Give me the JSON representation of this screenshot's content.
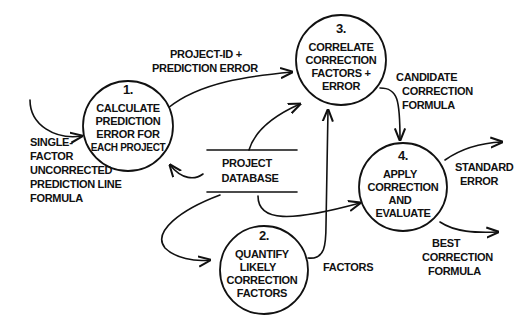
{
  "diagram": {
    "type": "data-flow-diagram",
    "processes": [
      {
        "id": "1",
        "number": "1.",
        "lines": [
          "CALCULATE",
          "PREDICTION",
          "ERROR FOR",
          "EACH PROJECT"
        ]
      },
      {
        "id": "2",
        "number": "2.",
        "lines": [
          "QUANTIFY",
          "LIKELY",
          "CORRECTION",
          "FACTORS"
        ]
      },
      {
        "id": "3",
        "number": "3.",
        "lines": [
          "CORRELATE",
          "CORRECTION",
          "FACTORS +",
          "ERROR"
        ]
      },
      {
        "id": "4",
        "number": "4.",
        "lines": [
          "APPLY",
          "CORRECTION",
          "AND",
          "EVALUATE"
        ]
      }
    ],
    "datastore": {
      "lines": [
        "PROJECT",
        "DATABASE"
      ]
    },
    "flows": {
      "input_formula": [
        "SINGLE-",
        "FACTOR",
        "UNCORRECTED",
        "PREDICTION LINE",
        "FORMULA"
      ],
      "project_id_error": [
        "PROJECT-ID +",
        "PREDICTION ERROR"
      ],
      "candidate_formula": [
        "CANDIDATE",
        "CORRECTION",
        "FORMULA"
      ],
      "factors": [
        "FACTORS"
      ],
      "standard_error": [
        "STANDARD",
        "ERROR"
      ],
      "best_formula": [
        "BEST",
        "CORRECTION",
        "FORMULA"
      ]
    }
  }
}
